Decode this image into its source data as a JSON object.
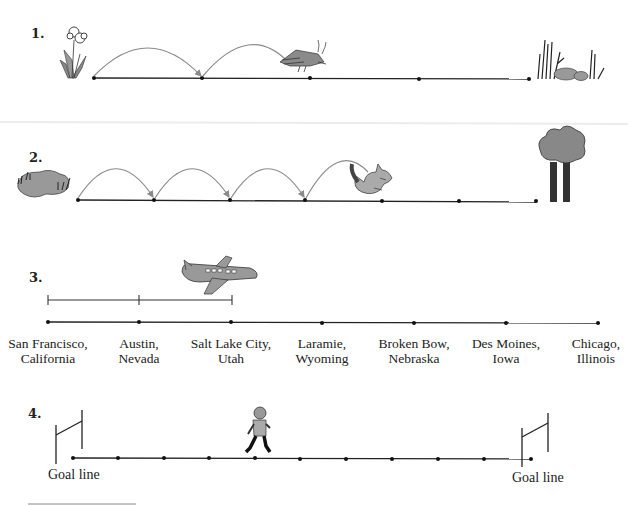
{
  "problems": [
    {
      "number": "1.",
      "start_icon": "flower-icon",
      "mover_icon": "grasshopper-icon",
      "end_icon": "grass-rocks-icon",
      "points": 5,
      "jumps_shown": 2
    },
    {
      "number": "2.",
      "start_icon": "pond-icon",
      "mover_icon": "kangaroo-icon",
      "end_icon": "trees-icon",
      "points": 7,
      "jumps_shown": 4
    },
    {
      "number": "3.",
      "mover_icon": "airplane-icon",
      "segments_shown": 2,
      "cities": [
        {
          "line1": "San Francisco,",
          "line2": "California"
        },
        {
          "line1": "Austin,",
          "line2": "Nevada"
        },
        {
          "line1": "Salt Lake City,",
          "line2": "Utah"
        },
        {
          "line1": "Laramie,",
          "line2": "Wyoming"
        },
        {
          "line1": "Broken Bow,",
          "line2": "Nebraska"
        },
        {
          "line1": "Des Moines,",
          "line2": "Iowa"
        },
        {
          "line1": "Chicago,",
          "line2": "Illinois"
        }
      ]
    },
    {
      "number": "4.",
      "mover_icon": "football-player-icon",
      "points": 11,
      "left_label": "Goal line",
      "right_label": "Goal line"
    }
  ]
}
